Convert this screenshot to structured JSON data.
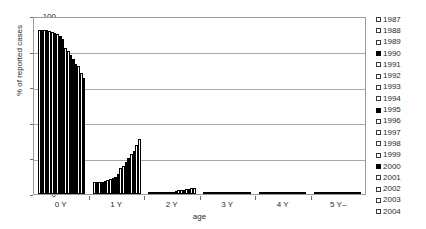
{
  "chart_data": {
    "type": "bar",
    "title": "",
    "xlabel": "age",
    "ylabel": "% of reported cases",
    "ylim": [
      0,
      100
    ],
    "yticks": [
      0,
      20,
      40,
      60,
      80,
      100
    ],
    "grid": true,
    "legend_position": "right",
    "categories": [
      "0 Y",
      "1 Y",
      "2 Y",
      "3 Y",
      "4 Y",
      "5 Y–"
    ],
    "series": [
      {
        "name": "1987",
        "filled": false,
        "values": [
          92.0,
          6.8,
          0.8,
          0.2,
          0.1,
          0.1
        ]
      },
      {
        "name": "1988",
        "filled": false,
        "values": [
          92.2,
          6.6,
          0.7,
          0.2,
          0.1,
          0.1
        ]
      },
      {
        "name": "1989",
        "filled": false,
        "values": [
          92.3,
          6.5,
          0.8,
          0.2,
          0.1,
          0.1
        ]
      },
      {
        "name": "1990",
        "filled": true,
        "values": [
          92.0,
          6.9,
          0.8,
          0.2,
          0.1,
          0.1
        ]
      },
      {
        "name": "1991",
        "filled": false,
        "values": [
          91.6,
          7.2,
          0.9,
          0.2,
          0.1,
          0.1
        ]
      },
      {
        "name": "1992",
        "filled": false,
        "values": [
          91.0,
          7.8,
          1.0,
          0.2,
          0.1,
          0.1
        ]
      },
      {
        "name": "1993",
        "filled": false,
        "values": [
          90.4,
          8.4,
          1.0,
          0.2,
          0.1,
          0.1
        ]
      },
      {
        "name": "1994",
        "filled": false,
        "values": [
          89.8,
          9.0,
          1.1,
          0.2,
          0.1,
          0.1
        ]
      },
      {
        "name": "1995",
        "filled": true,
        "values": [
          89.0,
          9.7,
          1.2,
          0.2,
          0.1,
          0.1
        ]
      },
      {
        "name": "1996",
        "filled": false,
        "values": [
          87.0,
          11.5,
          1.3,
          0.2,
          0.1,
          0.1
        ]
      },
      {
        "name": "1997",
        "filled": false,
        "values": [
          82.0,
          14.8,
          1.8,
          0.4,
          0.2,
          0.1
        ]
      },
      {
        "name": "1998",
        "filled": false,
        "values": [
          80.5,
          16.0,
          2.0,
          0.4,
          0.2,
          0.1
        ]
      },
      {
        "name": "1999",
        "filled": false,
        "values": [
          78.0,
          18.2,
          2.3,
          0.5,
          0.2,
          0.1
        ]
      },
      {
        "name": "2000",
        "filled": true,
        "values": [
          76.0,
          20.0,
          2.5,
          0.5,
          0.2,
          0.1
        ]
      },
      {
        "name": "2001",
        "filled": false,
        "values": [
          73.0,
          22.5,
          2.8,
          0.6,
          0.3,
          0.1
        ]
      },
      {
        "name": "2002",
        "filled": false,
        "values": [
          72.0,
          24.0,
          3.0,
          0.6,
          0.3,
          0.1
        ]
      },
      {
        "name": "2003",
        "filled": false,
        "values": [
          68.0,
          27.5,
          3.4,
          0.7,
          0.3,
          0.2
        ]
      },
      {
        "name": "2004",
        "filled": false,
        "values": [
          65.0,
          31.0,
          3.6,
          0.8,
          0.3,
          0.2
        ]
      }
    ]
  }
}
